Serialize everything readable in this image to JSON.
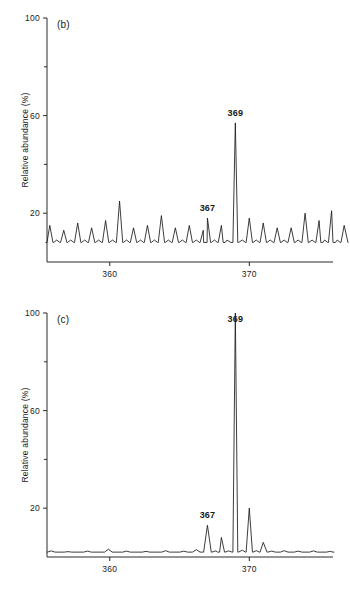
{
  "figure": {
    "caption_letters": [
      "(b)",
      "(c)"
    ],
    "background_color": "#ffffff",
    "trace_color": "#1a1a1a",
    "axis_color": "#2a2a2a"
  },
  "chart_data": [
    {
      "type": "line",
      "title": "(b)",
      "panel_label": "(b)",
      "xlabel": "",
      "ylabel": "Relative abundance (%)",
      "xlim": [
        355.5,
        376.0
      ],
      "ylim": [
        0,
        100
      ],
      "xticks": [
        360,
        370
      ],
      "xticklabels": [
        "360",
        "370"
      ],
      "yticks": [
        20,
        40,
        60,
        80,
        100
      ],
      "yticklabels": [
        "20",
        "",
        "60",
        "",
        "100"
      ],
      "ylabeled_ticks": [
        20,
        60,
        100
      ],
      "grid": false,
      "legend": null,
      "annotations": [
        {
          "text": "369",
          "x": 369,
          "y": 57
        },
        {
          "text": "367",
          "x": 367,
          "y": 18
        }
      ],
      "baseline": 8,
      "peaks": [
        {
          "x": 355.7,
          "y": 15
        },
        {
          "x": 356.2,
          "y": 9
        },
        {
          "x": 356.7,
          "y": 13
        },
        {
          "x": 357.2,
          "y": 9
        },
        {
          "x": 357.7,
          "y": 16
        },
        {
          "x": 358.2,
          "y": 9
        },
        {
          "x": 358.7,
          "y": 14
        },
        {
          "x": 359.2,
          "y": 9
        },
        {
          "x": 359.7,
          "y": 17
        },
        {
          "x": 360.2,
          "y": 9
        },
        {
          "x": 360.7,
          "y": 25
        },
        {
          "x": 361.2,
          "y": 9
        },
        {
          "x": 361.7,
          "y": 14
        },
        {
          "x": 362.2,
          "y": 9
        },
        {
          "x": 362.7,
          "y": 15
        },
        {
          "x": 363.2,
          "y": 9
        },
        {
          "x": 363.7,
          "y": 19
        },
        {
          "x": 364.2,
          "y": 9
        },
        {
          "x": 364.7,
          "y": 14
        },
        {
          "x": 365.2,
          "y": 9
        },
        {
          "x": 365.7,
          "y": 15
        },
        {
          "x": 366.2,
          "y": 9
        },
        {
          "x": 366.7,
          "y": 13
        },
        {
          "x": 367.0,
          "y": 18
        },
        {
          "x": 367.5,
          "y": 9
        },
        {
          "x": 368.0,
          "y": 15
        },
        {
          "x": 368.4,
          "y": 9
        },
        {
          "x": 369.0,
          "y": 57
        },
        {
          "x": 369.5,
          "y": 9
        },
        {
          "x": 370.0,
          "y": 18
        },
        {
          "x": 370.5,
          "y": 9
        },
        {
          "x": 371.0,
          "y": 16
        },
        {
          "x": 371.5,
          "y": 9
        },
        {
          "x": 372.0,
          "y": 14
        },
        {
          "x": 372.5,
          "y": 9
        },
        {
          "x": 373.0,
          "y": 14
        },
        {
          "x": 373.5,
          "y": 9
        },
        {
          "x": 374.0,
          "y": 20
        },
        {
          "x": 374.5,
          "y": 9
        },
        {
          "x": 375.0,
          "y": 17
        },
        {
          "x": 375.4,
          "y": 9
        },
        {
          "x": 375.9,
          "y": 21
        },
        {
          "x": 376.3,
          "y": 9
        },
        {
          "x": 376.8,
          "y": 15
        }
      ]
    },
    {
      "type": "line",
      "title": "(c)",
      "panel_label": "(c)",
      "xlabel": "",
      "ylabel": "Relative abundance (%)",
      "xlim": [
        355.5,
        376.0
      ],
      "ylim": [
        0,
        100
      ],
      "xticks": [
        360,
        370
      ],
      "xticklabels": [
        "360",
        "370"
      ],
      "yticks": [
        20,
        40,
        60,
        80,
        100
      ],
      "yticklabels": [
        "20",
        "",
        "60",
        "",
        "100"
      ],
      "ylabeled_ticks": [
        20,
        60,
        100
      ],
      "grid": false,
      "legend": null,
      "annotations": [
        {
          "text": "369",
          "x": 369,
          "y": 100
        },
        {
          "text": "367",
          "x": 367,
          "y": 13
        }
      ],
      "baseline": 2,
      "peaks": [
        {
          "x": 355.8,
          "y": 2.5
        },
        {
          "x": 357.0,
          "y": 2.2
        },
        {
          "x": 358.4,
          "y": 2.4
        },
        {
          "x": 359.9,
          "y": 3.2
        },
        {
          "x": 361.2,
          "y": 2.4
        },
        {
          "x": 362.6,
          "y": 2.3
        },
        {
          "x": 364.0,
          "y": 2.6
        },
        {
          "x": 365.3,
          "y": 2.4
        },
        {
          "x": 366.2,
          "y": 3.0
        },
        {
          "x": 367.0,
          "y": 13
        },
        {
          "x": 367.6,
          "y": 2.5
        },
        {
          "x": 368.0,
          "y": 8
        },
        {
          "x": 368.5,
          "y": 2.5
        },
        {
          "x": 369.0,
          "y": 100
        },
        {
          "x": 369.5,
          "y": 2.8
        },
        {
          "x": 370.0,
          "y": 20
        },
        {
          "x": 370.5,
          "y": 2.6
        },
        {
          "x": 371.0,
          "y": 6
        },
        {
          "x": 371.6,
          "y": 2.4
        },
        {
          "x": 372.5,
          "y": 2.6
        },
        {
          "x": 373.5,
          "y": 2.4
        },
        {
          "x": 374.6,
          "y": 2.5
        },
        {
          "x": 375.8,
          "y": 2.3
        }
      ]
    }
  ]
}
